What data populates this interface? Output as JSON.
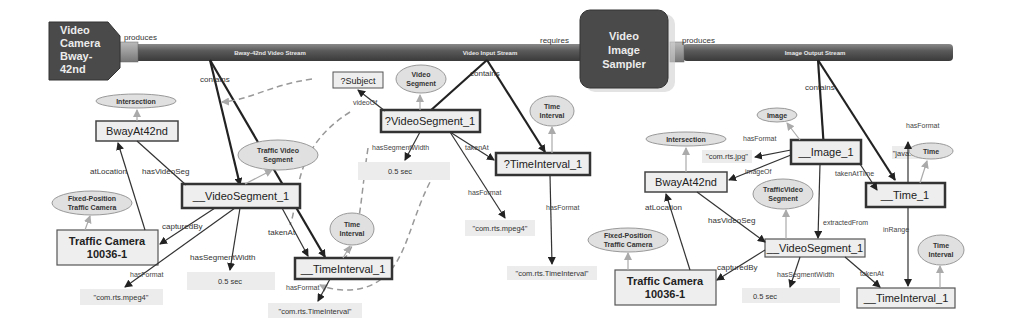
{
  "components": {
    "camera": {
      "lines": [
        "Video",
        "Camera",
        "Bway-",
        "42nd"
      ]
    },
    "sampler": {
      "lines": [
        "Video",
        "Image",
        "Sampler"
      ]
    }
  },
  "streams": {
    "bway_stream": "Bway-42nd Video Stream",
    "video_input": "Video Input Stream",
    "image_output": "Image Output Stream"
  },
  "relations": {
    "produces_1": "produces",
    "requires": "requires",
    "produces_2": "produces",
    "contains_1": "contains",
    "contains_2": "contains",
    "contains_3": "contains"
  },
  "left_graph": {
    "intersection_class": "Intersection",
    "bway": "BwayAt42nd",
    "traffic_video_segment_class": [
      "Traffic Video",
      "Segment"
    ],
    "video_segment": "__VideoSegment_1",
    "fixed_camera_class": [
      "Fixed-Position",
      "Traffic Camera"
    ],
    "traffic_camera": [
      "Traffic Camera",
      "10036-1"
    ],
    "time_interval_class": [
      "Time",
      "Interval"
    ],
    "time_interval": "__TimeInterval_1",
    "lit_mpeg": "\"com.rts.mpeg4\"",
    "lit_width": "0.5 sec",
    "lit_time": "\"com.rts.TimeInterval\"",
    "edges": {
      "atLocation": "atLocation",
      "hasVideoSeg": "hasVideoSeg",
      "capturedBy": "capturedBy",
      "hasFormat_1": "hasFormat",
      "hasSegmentWidth": "hasSegmentWidth",
      "takenAt": "takenAt",
      "hasFormat_2": "hasFormat"
    }
  },
  "middle_graph": {
    "subject": "?Subject",
    "video_segment_class": [
      "Video",
      "Segment"
    ],
    "video_segment": "?VideoSegment_1",
    "time_interval_class": [
      "Time",
      "Interval"
    ],
    "time_interval": "?TimeInterval_1",
    "lit_width": "0.5 sec",
    "lit_mpeg": "\"com.rts.mpeg4\"",
    "lit_time": "\"com.rts.TimeInterval\"",
    "edges": {
      "videoOf": "videoOf",
      "hasSegmentWidth": "hasSegmentWidth",
      "takenAt": "takenAt",
      "hasFormat_1": "hasFormat",
      "hasFormat_2": "hasFormat"
    }
  },
  "right_graph": {
    "image_class": "Image",
    "intersection_class": "Intersection",
    "lit_jpg": "\"com.rts.jpg\"",
    "image": "__Image_1",
    "bway": "BwayAt42nd",
    "traffic_video_segment_class": [
      "TrafficVideo",
      "Segment"
    ],
    "java_date": "\"java.util.Date\"",
    "time_class": "Time",
    "time": "__Time_1",
    "fixed_camera_class": [
      "Fixed-Position",
      "Traffic Camera"
    ],
    "video_segment": "__VideoSegment_1",
    "traffic_camera": [
      "Traffic Camera",
      "10036-1"
    ],
    "lit_width": "0.5 sec",
    "time_interval_class": [
      "Time",
      "Interval"
    ],
    "time_interval": "__TimeInterval_1",
    "edges": {
      "hasFormat_1": "hasFormat",
      "imageOf": "imageOf",
      "takenAtTime": "takenAtTime",
      "hasFormat_2": "hasFormat",
      "atLocation": "atLocation",
      "hasVideoSeg": "hasVideoSeg",
      "extractedFrom": "extractedFrom",
      "inRange": "inRange",
      "capturedBy": "capturedBy",
      "hasSegmentWidth": "hasSegmentWidth",
      "takenAt": "takenAt"
    }
  }
}
